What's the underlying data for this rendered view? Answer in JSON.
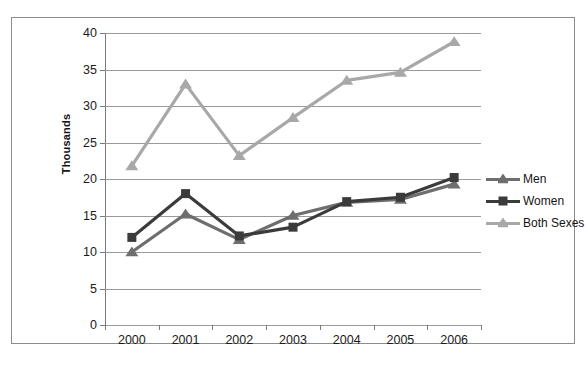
{
  "chart_data": {
    "type": "line",
    "title": "",
    "xlabel": "",
    "ylabel": "Thousands",
    "x": [
      "2000",
      "2001",
      "2002",
      "2003",
      "2004",
      "2005",
      "2006"
    ],
    "categories": [
      "2000",
      "2001",
      "2002",
      "2003",
      "2004",
      "2005",
      "2006"
    ],
    "ylim": [
      0,
      40
    ],
    "yticks": [
      "0",
      "5",
      "10",
      "15",
      "20",
      "25",
      "30",
      "35",
      "40"
    ],
    "grid": "horizontal",
    "legend_position": "right",
    "series": [
      {
        "name": "Men",
        "values": [
          10.0,
          15.2,
          11.7,
          15.0,
          16.8,
          17.2,
          19.3
        ],
        "color": "#6e6e6e",
        "marker": "triangle"
      },
      {
        "name": "Women",
        "values": [
          12.0,
          18.0,
          12.2,
          13.4,
          16.9,
          17.5,
          20.2
        ],
        "color": "#3b3b3b",
        "marker": "square"
      },
      {
        "name": "Both Sexes",
        "values": [
          21.8,
          33.0,
          23.2,
          28.4,
          33.5,
          34.6,
          38.8
        ],
        "color": "#a8a8a8",
        "marker": "triangle"
      }
    ]
  },
  "colors": {
    "men": "#6e6e6e",
    "women": "#3b3b3b",
    "both_sexes": "#a8a8a8",
    "gridline": "#9a9a9a",
    "axis": "#7a7a7a",
    "border": "#8c8c8c",
    "text": "#1a1a1a",
    "background": "#ffffff"
  },
  "legend": {
    "items": [
      {
        "label": "Men"
      },
      {
        "label": "Women"
      },
      {
        "label": "Both Sexes"
      }
    ]
  }
}
